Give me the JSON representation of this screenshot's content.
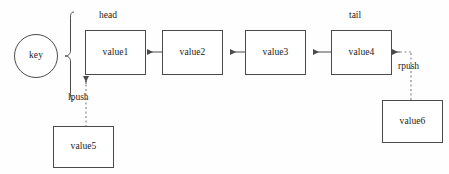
{
  "diagram": {
    "background_color": "#fefefe",
    "stroke_color": "#4a4a4a",
    "text_color": "#1a1a1a",
    "key_node": {
      "label": "key"
    },
    "pointer_labels": {
      "head": "head",
      "tail": "tail"
    },
    "operation_labels": {
      "lpush": "lpush",
      "rpush": "rpush"
    },
    "list_nodes": [
      {
        "label": "value1"
      },
      {
        "label": "value2"
      },
      {
        "label": "value3"
      },
      {
        "label": "value4"
      }
    ],
    "pending_nodes": [
      {
        "label": "value5"
      },
      {
        "label": "value6"
      }
    ]
  }
}
